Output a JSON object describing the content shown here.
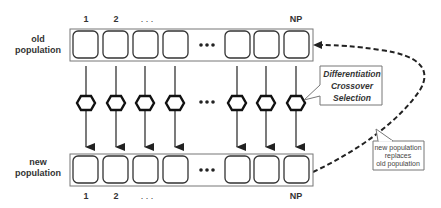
{
  "diagram": {
    "old_population": {
      "label_line1": "old",
      "label_line2": "population",
      "indices": {
        "first": "1",
        "second": "2",
        "ellipsis": ". . .",
        "last": "NP"
      }
    },
    "new_population": {
      "label_line1": "new",
      "label_line2": "population",
      "indices": {
        "first": "1",
        "second": "2",
        "ellipsis": ". . .",
        "last": "NP"
      }
    },
    "operators_callout": {
      "line1": "Differentiation",
      "line2": "Crossover",
      "line3": "Selection"
    },
    "replacement_note": {
      "line1": "new population",
      "line2": "replaces",
      "line3": "old population"
    },
    "ellipsis_dots": "•••",
    "colors": {
      "stroke": "#333333",
      "box_border": "#777777",
      "background": "#ffffff"
    }
  }
}
